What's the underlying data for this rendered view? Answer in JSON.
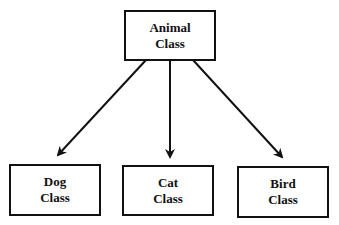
{
  "diagram": {
    "type": "class-hierarchy",
    "root": {
      "line1": "Animal",
      "line2": "Class"
    },
    "children": [
      {
        "line1": "Dog",
        "line2": "Class"
      },
      {
        "line1": "Cat",
        "line2": "Class"
      },
      {
        "line1": "Bird",
        "line2": "Class"
      }
    ],
    "edges": [
      {
        "from": "Animal Class",
        "to": "Dog Class"
      },
      {
        "from": "Animal Class",
        "to": "Cat Class"
      },
      {
        "from": "Animal Class",
        "to": "Bird Class"
      }
    ],
    "colors": {
      "stroke": "#111111",
      "background": "#ffffff"
    }
  }
}
